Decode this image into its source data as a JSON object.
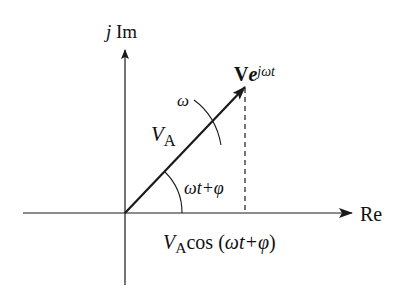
{
  "diagram": {
    "type": "phasor-diagram",
    "axes": {
      "vertical_label_j": "j",
      "vertical_label_im": "Im",
      "horizontal_label": "Re"
    },
    "phasor": {
      "label_bold": "V",
      "label_e": "e",
      "label_exp": "jωt",
      "magnitude_symbol": "V",
      "magnitude_sub": "A"
    },
    "rotation_label": "ω",
    "angle_label": "ωt+φ",
    "projection_label": {
      "symbol": "V",
      "sub": "A",
      "text": "cos (",
      "arg": "ωt+φ",
      "close": ")"
    },
    "colors": {
      "line": "#1a1a1a",
      "background": "#ffffff"
    }
  }
}
